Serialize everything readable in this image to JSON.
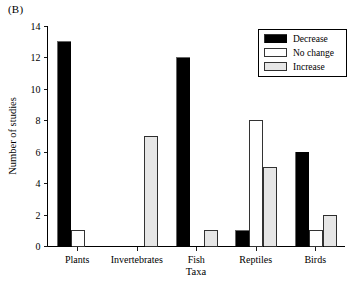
{
  "panel": {
    "label": "(B)"
  },
  "chart_data": {
    "type": "bar",
    "title": "",
    "panel_label": "(B)",
    "xlabel": "Taxa",
    "ylabel": "Number of studies",
    "categories": [
      "Plants",
      "Invertebrates",
      "Fish",
      "Reptiles",
      "Birds"
    ],
    "series": [
      {
        "name": "Decrease",
        "color": "#000000",
        "values": [
          13,
          0,
          12,
          1,
          6
        ]
      },
      {
        "name": "No change",
        "color": "#ffffff",
        "values": [
          1,
          0,
          0,
          8,
          1
        ]
      },
      {
        "name": "Increase",
        "color": "#e6e6e6",
        "values": [
          0,
          7,
          1,
          5,
          2
        ]
      }
    ],
    "ylim": [
      0,
      14
    ],
    "yticks": [
      0,
      2,
      4,
      6,
      8,
      10,
      12,
      14
    ],
    "ytick_labels": [
      "0",
      "2",
      "4",
      "6",
      "8",
      "10",
      "12",
      "14"
    ],
    "grid": false,
    "legend_position": "top-right",
    "bar_edge_color": "#000000",
    "axis_color": "#000000",
    "background": "#ffffff"
  },
  "legend": {
    "entries": [
      {
        "label": "Decrease",
        "swatch": "#000000"
      },
      {
        "label": "No change",
        "swatch": "#ffffff"
      },
      {
        "label": "Increase",
        "swatch": "#e6e6e6"
      }
    ]
  }
}
